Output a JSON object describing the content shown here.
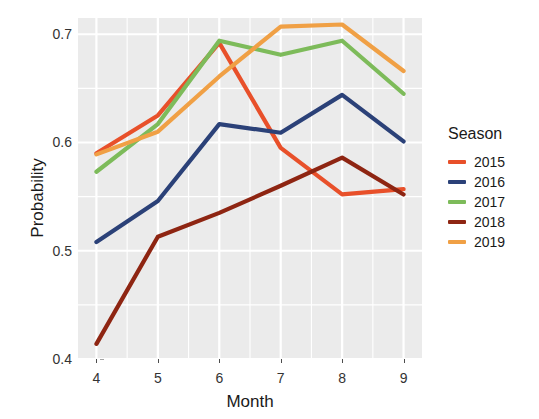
{
  "chart_data": {
    "type": "line",
    "title": "",
    "xlabel": "Month",
    "ylabel": "Probability",
    "x": [
      4,
      5,
      6,
      7,
      8,
      9
    ],
    "xticks": [
      "4",
      "5",
      "6",
      "7",
      "8",
      "9"
    ],
    "yticks": [
      "0.4",
      "0.5",
      "0.6",
      "0.7"
    ],
    "ytick_values": [
      0.4,
      0.5,
      0.6,
      0.7
    ],
    "xlim": [
      3.7,
      9.3
    ],
    "ylim": [
      0.4,
      0.715
    ],
    "grid": true,
    "grid_color": "#ffffff",
    "panel_background": "#ebebeb",
    "legend_position": "right",
    "legend_title": "Season",
    "series": [
      {
        "name": "2015",
        "color": "#e8502a",
        "values": [
          0.59,
          0.625,
          0.692,
          0.595,
          0.552,
          0.557
        ]
      },
      {
        "name": "2016",
        "color": "#2b4178",
        "values": [
          0.508,
          0.546,
          0.617,
          0.609,
          0.644,
          0.601
        ]
      },
      {
        "name": "2017",
        "color": "#7dbb5a",
        "values": [
          0.573,
          0.617,
          0.694,
          0.681,
          0.694,
          0.645
        ]
      },
      {
        "name": "2018",
        "color": "#8e2512",
        "values": [
          0.414,
          0.513,
          0.535,
          0.56,
          0.586,
          0.552
        ]
      },
      {
        "name": "2019",
        "color": "#f0a045",
        "values": [
          0.589,
          0.61,
          0.661,
          0.707,
          0.709,
          0.666
        ]
      }
    ]
  },
  "axis": {
    "x_title": "Month",
    "y_title": "Probability"
  },
  "legend": {
    "title": "Season",
    "items": [
      {
        "label": "2015",
        "color": "#e8502a"
      },
      {
        "label": "2016",
        "color": "#2b4178"
      },
      {
        "label": "2017",
        "color": "#7dbb5a"
      },
      {
        "label": "2018",
        "color": "#8e2512"
      },
      {
        "label": "2019",
        "color": "#f0a045"
      }
    ]
  }
}
